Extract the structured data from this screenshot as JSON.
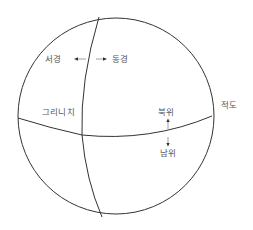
{
  "diagram": {
    "type": "globe-coordinate-diagram",
    "colors": {
      "line": "#333333",
      "text": "#555555",
      "background": "#ffffff"
    },
    "globe": {
      "center": [
        116,
        116
      ],
      "radius": 98
    },
    "labels": {
      "west_longitude": "서경",
      "east_longitude": "동경",
      "greenwich": "그리니치",
      "north_latitude": "북위",
      "south_latitude": "남위",
      "equator": "적도"
    },
    "lines": {
      "prime_meridian": "Greenwich meridian (curved vertical line)",
      "equator": "equator (curved horizontal line)"
    },
    "arrows": {
      "west": "left arrow toward 서경",
      "east": "right arrow toward 동경",
      "north": "up arrow toward 북위",
      "south": "down arrow toward 남위"
    }
  }
}
